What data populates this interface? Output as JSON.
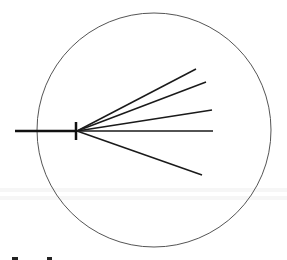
{
  "diagram": {
    "type": "radial-fan",
    "canvas": {
      "width": 287,
      "height": 260,
      "background": "#ffffff"
    },
    "circle": {
      "cx": 154,
      "cy": 130,
      "r": 117,
      "stroke": "#555555",
      "stroke_width": 1
    },
    "stem": {
      "x1": 15,
      "y1": 131,
      "x2": 76,
      "y2": 131,
      "stroke": "#111111",
      "stroke_width": 2.5
    },
    "tick": {
      "x1": 76,
      "y1": 122,
      "x2": 76,
      "y2": 140,
      "stroke": "#111111",
      "stroke_width": 2.5
    },
    "origin": {
      "x": 77,
      "y": 131
    },
    "rays": [
      {
        "x2": 196,
        "y2": 69
      },
      {
        "x2": 206,
        "y2": 82
      },
      {
        "x2": 212,
        "y2": 110
      },
      {
        "x2": 213,
        "y2": 131
      },
      {
        "x2": 202,
        "y2": 175
      }
    ],
    "ray_stroke": "#1a1a1a",
    "ray_stroke_width": 1.5
  },
  "ghost_bands": [
    {
      "y": 188
    },
    {
      "y": 196
    }
  ],
  "fragments": [
    {
      "x": 12,
      "y": 257,
      "w": 6,
      "h": 3
    },
    {
      "x": 47,
      "y": 257,
      "w": 5,
      "h": 3
    }
  ]
}
